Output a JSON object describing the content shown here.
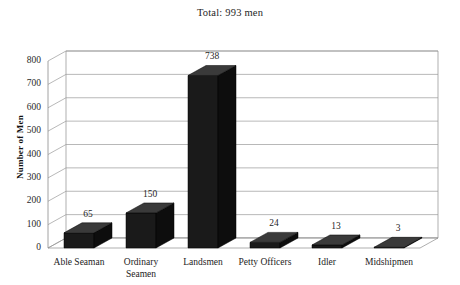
{
  "chart_data": {
    "type": "bar",
    "title": "Total: 993 men",
    "xlabel": "",
    "ylabel": "Number of Men",
    "categories": [
      "Able Seaman",
      "Ordinary\nSeamen",
      "Landsmen",
      "Petty Officers",
      "Idler",
      "Midshipmen"
    ],
    "values": [
      65,
      150,
      738,
      24,
      13,
      3
    ],
    "value_labels": [
      "65",
      "150",
      "738",
      "24",
      "13",
      "3"
    ],
    "ylim": [
      0,
      800
    ],
    "yticks": [
      0,
      100,
      200,
      300,
      400,
      500,
      600,
      700,
      800
    ],
    "ytick_labels": [
      "0",
      "100",
      "200",
      "300",
      "400",
      "500",
      "600",
      "700",
      "800"
    ],
    "grid": true,
    "legend": false,
    "style": "3d-column",
    "total": 993,
    "colors": {
      "bar_front": "#1a1a1a",
      "bar_top": "#3a3a3a",
      "bar_side": "#0d0d0d",
      "gridline": "#9a9a9a",
      "axis": "#8c8c8c",
      "background": "#ffffff",
      "text": "#1f1f1f"
    }
  }
}
